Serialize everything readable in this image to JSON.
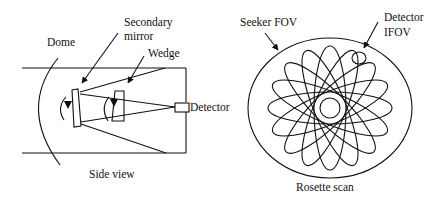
{
  "side_view": {
    "caption": "Side view",
    "labels": {
      "secondary_mirror_line1": "Secondary",
      "secondary_mirror_line2": "mirror",
      "wedge": "Wedge",
      "dome": "Dome",
      "detector": "Detector"
    }
  },
  "rosette": {
    "caption": "Rosette scan",
    "labels": {
      "seeker_fov": "Seeker FOV",
      "detector_line1": "Detector",
      "detector_line2": "IFOV"
    },
    "petal_count": 8
  }
}
